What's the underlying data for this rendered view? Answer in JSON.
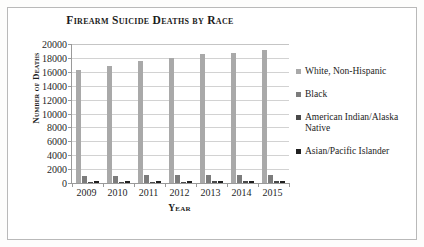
{
  "chart_data": {
    "type": "bar",
    "title": "Firearm Suicide Deaths by Race",
    "xlabel": "Year",
    "ylabel": "Number of Deaths",
    "categories": [
      "2009",
      "2010",
      "2011",
      "2012",
      "2013",
      "2014",
      "2015"
    ],
    "ylim": [
      0,
      20000
    ],
    "ytick_labels": [
      "20000",
      "18000",
      "16000",
      "14000",
      "12000",
      "10000",
      "8000",
      "6000",
      "4000",
      "2000",
      "0"
    ],
    "ytick_values": [
      20000,
      18000,
      16000,
      14000,
      12000,
      10000,
      8000,
      6000,
      4000,
      2000,
      0
    ],
    "grid": true,
    "legend_position": "right",
    "series": [
      {
        "name": "White, Non-Hispanic",
        "color": "#a9a9a9",
        "values": [
          16300,
          16900,
          17600,
          18000,
          18550,
          18650,
          19200
        ]
      },
      {
        "name": "Black",
        "color": "#7c7c7c",
        "values": [
          1030,
          1080,
          1120,
          1160,
          1150,
          1170,
          1200
        ]
      },
      {
        "name": "American Indian/Alaska Native",
        "color": "#4a4a4a",
        "values": [
          180,
          190,
          200,
          210,
          220,
          230,
          250
        ]
      },
      {
        "name": "Asian/Pacific Islander",
        "color": "#202020",
        "values": [
          230,
          240,
          250,
          260,
          290,
          300,
          330
        ]
      }
    ]
  },
  "legend": {
    "items": [
      {
        "label": "White, Non-Hispanic",
        "color": "#a9a9a9"
      },
      {
        "label": "Black",
        "color": "#7c7c7c"
      },
      {
        "label": "American Indian/Alaska Native",
        "color": "#4a4a4a"
      },
      {
        "label": "Asian/Pacific Islander",
        "color": "#202020"
      }
    ]
  }
}
